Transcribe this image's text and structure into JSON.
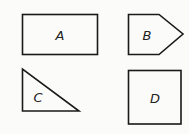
{
  "shapes": [
    {
      "label": "A",
      "type": "rectangle"
    },
    {
      "label": "B",
      "type": "pentagon"
    },
    {
      "label": "C",
      "type": "right-triangle"
    },
    {
      "label": "D",
      "type": "square"
    }
  ],
  "colors": {
    "stroke": "#1a1a1a",
    "background": "#fbfbf9"
  }
}
